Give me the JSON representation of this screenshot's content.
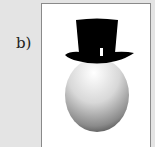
{
  "figure": {
    "label": "b)",
    "content": {
      "subject": "egg-with-top-hat",
      "colors": {
        "hat": "#000000",
        "egg_light": "#ffffff",
        "egg_dark": "#3a3a3a",
        "background": "#e4e4e4",
        "frame": "#ffffff"
      }
    }
  }
}
